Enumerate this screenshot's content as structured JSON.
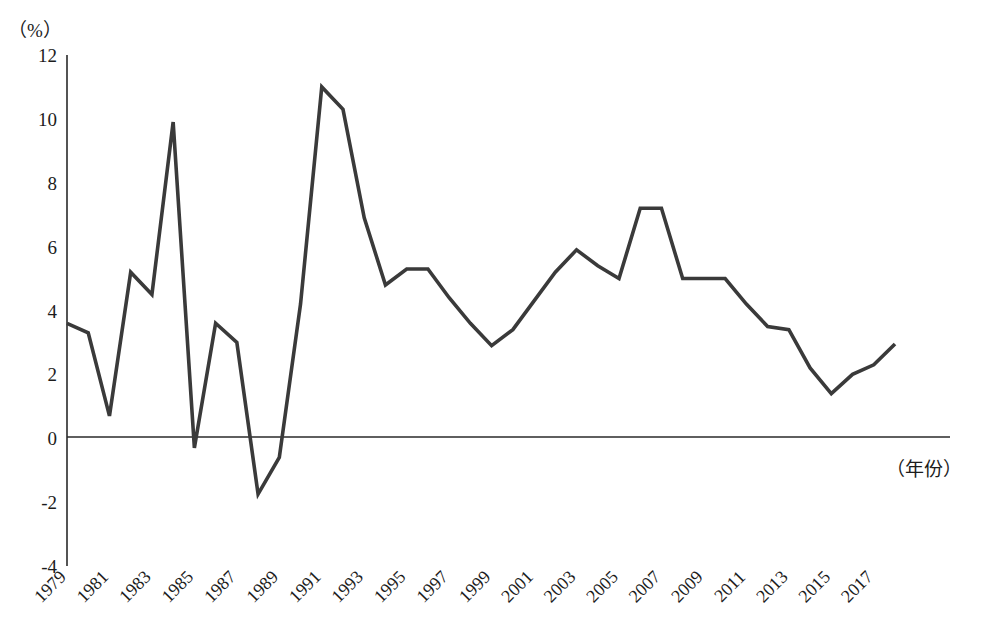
{
  "chart_data": {
    "type": "line",
    "title": "",
    "subtitle": "",
    "xlabel": "（年份）",
    "ylabel": "（%）",
    "y_unit_label": "（%）",
    "x_unit_label": "（年份）",
    "grid": false,
    "legend": false,
    "legend_position": "none",
    "line_color": "#3a3a3a",
    "axis_color": "#2a2a2a",
    "xlim": [
      1979,
      2018
    ],
    "ylim": [
      -4,
      12
    ],
    "ytick_values": [
      12,
      10,
      8,
      6,
      4,
      2,
      0,
      -2,
      -4
    ],
    "ytick_labels": [
      "12",
      "10",
      "8",
      "6",
      "4",
      "2",
      "0",
      "-2",
      "-4"
    ],
    "xtick_labels": [
      "1979",
      "1981",
      "1983",
      "1985",
      "1987",
      "1989",
      "1991",
      "1993",
      "1995",
      "1997",
      "1999",
      "2001",
      "2003",
      "2005",
      "2007",
      "2009",
      "2011",
      "2013",
      "2015",
      "2017"
    ],
    "xtick_values": [
      1979,
      1981,
      1983,
      1985,
      1987,
      1989,
      1991,
      1993,
      1995,
      1997,
      1999,
      2001,
      2003,
      2005,
      2007,
      2009,
      2011,
      2013,
      2015,
      2017
    ],
    "x": [
      1979,
      1980,
      1981,
      1982,
      1983,
      1984,
      1985,
      1986,
      1987,
      1988,
      1989,
      1990,
      1991,
      1992,
      1993,
      1994,
      1995,
      1996,
      1997,
      1998,
      1999,
      2000,
      2001,
      2002,
      2003,
      2004,
      2005,
      2006,
      2007,
      2008,
      2009,
      2010,
      2011,
      2012,
      2013,
      2014,
      2015,
      2016,
      2017,
      2018
    ],
    "values": [
      3.6,
      3.3,
      0.7,
      5.2,
      4.5,
      9.9,
      -0.3,
      3.6,
      3.0,
      -1.75,
      -0.6,
      4.2,
      11.0,
      10.3,
      6.9,
      4.8,
      5.3,
      5.3,
      4.4,
      3.6,
      2.9,
      3.4,
      4.3,
      5.2,
      5.9,
      5.4,
      5.0,
      7.2,
      7.2,
      5.0,
      5.0,
      5.0,
      4.2,
      3.5,
      3.4,
      2.2,
      1.4,
      2.0,
      2.3,
      2.95
    ],
    "series": [
      {
        "name": "增长率",
        "values": [
          3.6,
          3.3,
          0.7,
          5.2,
          4.5,
          9.9,
          -0.3,
          3.6,
          3.0,
          -1.75,
          -0.6,
          4.2,
          11.0,
          10.3,
          6.9,
          4.8,
          5.3,
          5.3,
          4.4,
          3.6,
          2.9,
          3.4,
          4.3,
          5.2,
          5.9,
          5.4,
          5.0,
          7.2,
          7.2,
          5.0,
          5.0,
          5.0,
          4.2,
          3.5,
          3.4,
          2.2,
          1.4,
          2.0,
          2.3,
          2.95
        ]
      }
    ]
  },
  "axes": {
    "y_unit": "（%）",
    "x_unit": "（年份）"
  }
}
